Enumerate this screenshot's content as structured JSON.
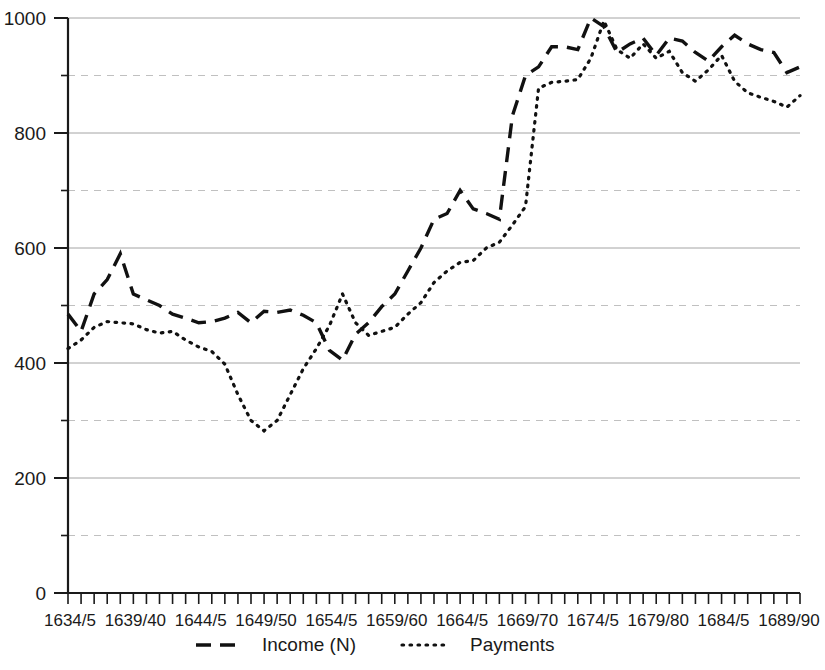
{
  "chart_data": {
    "type": "line",
    "title": "",
    "subtitle": "",
    "xlabel": "",
    "ylabel": "",
    "ylim": [
      0,
      1000
    ],
    "y_major_ticks": [
      0,
      200,
      400,
      600,
      800,
      1000
    ],
    "y_minor_gridlines": [
      100,
      300,
      500,
      700,
      900
    ],
    "y_tick_labels": [
      "0",
      "200",
      "400",
      "600",
      "800",
      "1000"
    ],
    "grid": "horizontal",
    "legend_position": "bottom",
    "x": [
      "1634/5",
      "1635/6",
      "1636/7",
      "1637/8",
      "1638/9",
      "1639/40",
      "1640/1",
      "1641/2",
      "1642/3",
      "1643/4",
      "1644/5",
      "1645/6",
      "1646/7",
      "1647/8",
      "1648/9",
      "1649/50",
      "1650/1",
      "1651/2",
      "1652/3",
      "1653/4",
      "1654/5",
      "1655/6",
      "1656/7",
      "1657/8",
      "1658/9",
      "1659/60",
      "1660/1",
      "1661/2",
      "1662/3",
      "1663/4",
      "1664/5",
      "1665/6",
      "1666/7",
      "1667/8",
      "1668/9",
      "1669/70",
      "1670/1",
      "1671/2",
      "1672/3",
      "1673/4",
      "1674/5",
      "1675/6",
      "1676/7",
      "1677/8",
      "1678/9",
      "1679/80",
      "1680/1",
      "1681/2",
      "1682/3",
      "1683/4",
      "1684/5",
      "1685/6",
      "1686/7",
      "1687/8",
      "1688/9",
      "1689/90",
      "1690/1"
    ],
    "x_tick_labels": [
      "1634/5",
      "1639/40",
      "1644/5",
      "1649/50",
      "1654/5",
      "1659/60",
      "1664/5",
      "1669/70",
      "1674/5",
      "1679/80",
      "1684/5",
      "1689/90"
    ],
    "x_tick_label_indices": [
      0,
      5,
      10,
      15,
      20,
      25,
      30,
      35,
      40,
      45,
      50,
      55
    ],
    "series": [
      {
        "name": "Income (N)",
        "style": "dashed",
        "color": "#111111",
        "values": [
          485,
          455,
          520,
          545,
          590,
          520,
          510,
          500,
          485,
          478,
          470,
          472,
          478,
          488,
          470,
          490,
          488,
          492,
          483,
          470,
          422,
          405,
          450,
          470,
          498,
          520,
          560,
          600,
          650,
          660,
          700,
          668,
          660,
          650,
          830,
          900,
          915,
          950,
          950,
          945,
          1000,
          985,
          940,
          955,
          965,
          935,
          965,
          960,
          940,
          925,
          950,
          970,
          955,
          945,
          940,
          905,
          915
        ]
      },
      {
        "name": "Payments",
        "style": "dotted",
        "color": "#111111",
        "values": [
          425,
          440,
          462,
          472,
          470,
          468,
          458,
          452,
          455,
          440,
          428,
          420,
          398,
          345,
          300,
          282,
          300,
          345,
          390,
          425,
          465,
          520,
          470,
          448,
          455,
          462,
          485,
          505,
          540,
          560,
          575,
          578,
          600,
          610,
          640,
          672,
          878,
          888,
          890,
          893,
          930,
          995,
          945,
          930,
          955,
          930,
          942,
          905,
          890,
          910,
          935,
          890,
          870,
          862,
          855,
          845,
          865
        ]
      }
    ]
  },
  "legend": {
    "items": [
      {
        "label": "Income (N)",
        "style": "dashed"
      },
      {
        "label": "Payments",
        "style": "dotted"
      }
    ]
  }
}
